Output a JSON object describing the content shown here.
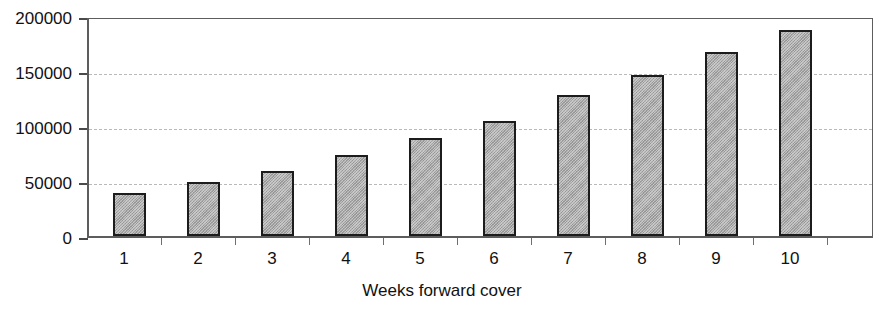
{
  "chart_data": {
    "type": "bar",
    "title": "",
    "subtitle": "",
    "xlabel": "Weeks forward cover",
    "ylabel": "",
    "categories": [
      "1",
      "2",
      "3",
      "4",
      "5",
      "6",
      "7",
      "8",
      "9",
      "10"
    ],
    "values": [
      40000,
      50000,
      60000,
      75000,
      90000,
      106000,
      130000,
      148000,
      170000,
      190000
    ],
    "series": [
      {
        "name": "",
        "values": [
          40000,
          50000,
          60000,
          75000,
          90000,
          106000,
          130000,
          148000,
          170000,
          190000
        ]
      }
    ],
    "ylim": [
      0,
      200000
    ],
    "ytick_labels": [
      "0",
      "50000",
      "100000",
      "150000",
      "200000"
    ],
    "ytick_values": [
      0,
      50000,
      100000,
      150000,
      200000
    ],
    "grid": true,
    "grid_axis": "y",
    "legend": false,
    "legend_position": "none",
    "annotations": [],
    "colors": {
      "bar_fill": "#a6a6a6",
      "bar_border": "#1c1c1c",
      "gridline": "#b9b9b9",
      "axis": "#5d5d5d",
      "text": "#111111",
      "background": "#ffffff"
    }
  },
  "caption": {
    "clipped_text": ""
  }
}
